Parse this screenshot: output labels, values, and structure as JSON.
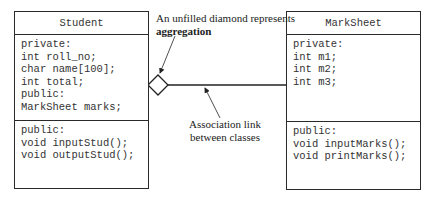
{
  "student": {
    "name": "Student",
    "attributes": [
      "private:",
      "int roll_no;",
      "char name[100];",
      "int total;",
      "public:",
      "MarkSheet marks;"
    ],
    "methods": [
      "public:",
      "void inputStud();",
      "void outputStud();"
    ]
  },
  "marksheet": {
    "name": "MarkSheet",
    "attributes": [
      "private:",
      "int m1;",
      "int m2;",
      "int m3;"
    ],
    "methods": [
      "public:",
      "void inputMarks();",
      "void printMarks();"
    ]
  },
  "annotations": {
    "aggregation_line1": "An unfilled diamond represents",
    "aggregation_line2": "aggregation",
    "association_line1": "Association link",
    "association_line2": "between classes"
  }
}
